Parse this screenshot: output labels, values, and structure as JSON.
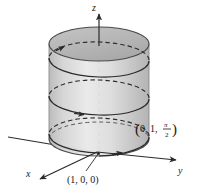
{
  "figure": {
    "background_color": "#ffffff",
    "axes": {
      "z": {
        "label": "z",
        "direction": "up"
      },
      "y": {
        "label": "y",
        "direction": "right"
      },
      "x": {
        "label": "x",
        "direction": "down-left"
      }
    },
    "labels": {
      "origin_point": "(1, 0, 0)",
      "upper_point_open": "(",
      "upper_point_xy": "0, 1,",
      "upper_point_num": "π",
      "upper_point_den": "2",
      "upper_point_close": ")"
    },
    "colors": {
      "cylinder_fill": "#c9c9c9",
      "cylinder_top_fill": "#b4b4b4",
      "cylinder_highlight": "#e0e0e0",
      "stroke": "#3a3a3a",
      "curve": "#2b2b2b",
      "text": "#1a1a1a"
    },
    "geometry": {
      "cylinder_center_x": 99,
      "cylinder_radius_x": 50,
      "cylinder_radius_y": 17,
      "cylinder_top_y": 44,
      "cylinder_bottom_y": 139,
      "origin_x": 97,
      "origin_y": 152,
      "helix_turns": 2.5,
      "radius": 1
    }
  }
}
